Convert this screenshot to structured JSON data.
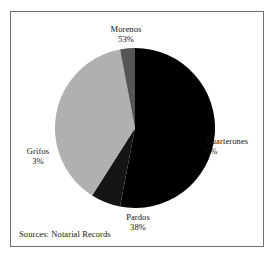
{
  "figure": {
    "background_color": "#ffffff",
    "frame_color": "#6f6f6f",
    "source_note": "Sources: Notarial Records"
  },
  "labels": {
    "morenos": {
      "name": "Morenos",
      "value": "53%"
    },
    "cuarterones": {
      "name": "Cuarterones",
      "value": "6%"
    },
    "grifos": {
      "name": "Grifos",
      "value": "3%"
    },
    "pardos": {
      "name": "Pardos",
      "value": "38%"
    }
  },
  "chart_data": {
    "type": "pie",
    "title": "",
    "subtitle": "",
    "xlabel": "",
    "ylabel": "",
    "legend_position": "none",
    "grid": false,
    "note": "Sources: Notarial Records",
    "start_angle_deg": 0,
    "direction": "clockwise",
    "center": {
      "x": 135,
      "y": 128
    },
    "radius": 80,
    "categories": [
      "Morenos",
      "Cuarterones",
      "Pardos",
      "Grifos"
    ],
    "values": [
      53,
      6,
      38,
      3
    ],
    "value_labels": [
      "53%",
      "6%",
      "38%",
      "3%"
    ],
    "colors": [
      "#000000",
      "#151515",
      "#b0b0b0",
      "#555555"
    ],
    "slices": [
      {
        "label": "Morenos",
        "value": 53,
        "value_label": "53%",
        "color": "#000000",
        "start_angle_deg": 0,
        "end_angle_deg": 190.8,
        "label_position": "top"
      },
      {
        "label": "Cuarterones",
        "value": 6,
        "value_label": "6%",
        "color": "#151515",
        "start_angle_deg": 190.8,
        "end_angle_deg": 212.4,
        "label_position": "right"
      },
      {
        "label": "Pardos",
        "value": 38,
        "value_label": "38%",
        "color": "#b0b0b0",
        "start_angle_deg": 212.4,
        "end_angle_deg": 349.2,
        "label_position": "bottom"
      },
      {
        "label": "Grifos",
        "value": 3,
        "value_label": "3%",
        "color": "#555555",
        "start_angle_deg": 349.2,
        "end_angle_deg": 360,
        "label_position": "left"
      }
    ]
  }
}
